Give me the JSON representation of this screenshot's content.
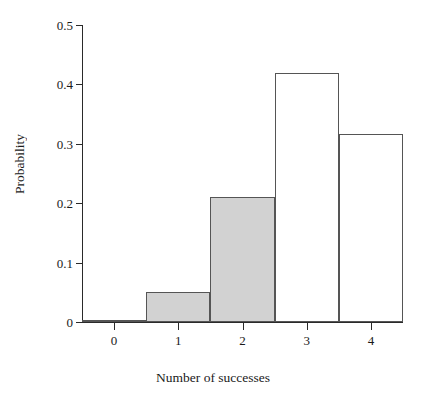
{
  "chart_data": {
    "type": "bar",
    "title": "",
    "subtitle": "",
    "xlabel": "Number of successes",
    "ylabel": "Probability",
    "categories": [
      "0",
      "1",
      "2",
      "3",
      "4"
    ],
    "values": [
      0.004,
      0.05,
      0.21,
      0.42,
      0.316
    ],
    "bar_fill_colors": [
      "#ffffff",
      "#d2d2d2",
      "#d2d2d2",
      "#ffffff",
      "#ffffff"
    ],
    "bar_edge_color": "#555555",
    "bar_width": 1,
    "xlim": [
      -0.5,
      4.5
    ],
    "ylim": [
      0,
      0.5
    ],
    "xticks": [
      0,
      1,
      2,
      3,
      4
    ],
    "xtick_labels": [
      "0",
      "1",
      "2",
      "3",
      "4"
    ],
    "yticks": [
      0,
      0.1,
      0.2,
      0.3,
      0.4,
      0.5
    ],
    "ytick_labels": [
      "0",
      "0.1",
      "0.2",
      "0.3",
      "0.4",
      "0.5"
    ],
    "grid": false,
    "legend": null,
    "legend_position": "none",
    "annotations": [],
    "background_color": "#ffffff",
    "axis_color": "#2a2a2a"
  }
}
